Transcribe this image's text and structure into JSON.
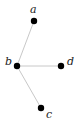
{
  "diagram": {
    "type": "graph",
    "colors": {
      "node": "#000000",
      "edge": "#c8c8c8",
      "label": "#222222",
      "background": "#ffffff"
    },
    "nodes": [
      {
        "id": "a",
        "label": "a",
        "x": 34,
        "y": 21,
        "label_x": 30,
        "label_y": 13
      },
      {
        "id": "b",
        "label": "b",
        "x": 17,
        "y": 66,
        "label_x": 5,
        "label_y": 65
      },
      {
        "id": "d",
        "label": "d",
        "x": 61,
        "y": 66,
        "label_x": 67,
        "label_y": 65
      },
      {
        "id": "c",
        "label": "c",
        "x": 41,
        "y": 108,
        "label_x": 46,
        "label_y": 118
      }
    ],
    "edges": [
      {
        "from": "b",
        "to": "a"
      },
      {
        "from": "b",
        "to": "d"
      },
      {
        "from": "b",
        "to": "c"
      }
    ]
  }
}
